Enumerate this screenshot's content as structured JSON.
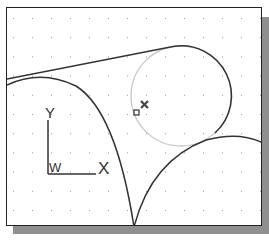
{
  "drawing": {
    "ucs_icon": {
      "y_label": "Y",
      "x_label": "X",
      "w_label": "W"
    },
    "entities": [
      {
        "type": "line",
        "role": "tangent-line"
      },
      {
        "type": "arc",
        "role": "left-arc"
      },
      {
        "type": "arc",
        "role": "right-arc"
      },
      {
        "type": "circle",
        "role": "construction-circle",
        "style": "highlighted"
      },
      {
        "type": "marker",
        "role": "tangent-snap-marker"
      },
      {
        "type": "marker",
        "role": "cursor-x-marker"
      }
    ],
    "grid": {
      "visible": true,
      "style": "dots"
    },
    "colors": {
      "entity": "#333333",
      "highlight": "#c8c8c8",
      "grid": "#9a9a9a",
      "frame": "#222222",
      "shadow": "#8f8f8f"
    }
  }
}
